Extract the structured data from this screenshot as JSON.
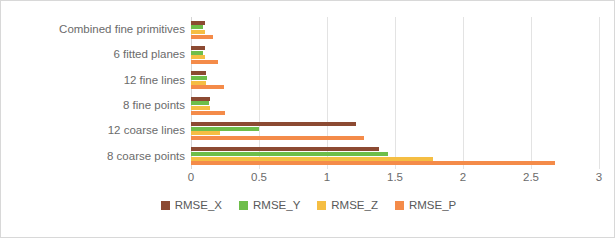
{
  "chart_data": {
    "type": "bar",
    "orientation": "horizontal",
    "title": "",
    "xlabel": "",
    "ylabel": "",
    "xlim": [
      0,
      3
    ],
    "xticks": [
      "0",
      "0.5",
      "1",
      "1.5",
      "2",
      "2.5",
      "3"
    ],
    "xtick_values": [
      0,
      0.5,
      1,
      1.5,
      2,
      2.5,
      3
    ],
    "grid": true,
    "legend_position": "bottom",
    "categories": [
      "Combined fine primitives",
      "6 fitted planes",
      "12 fine lines",
      "8 fine points",
      "12 coarse lines",
      "8 coarse points"
    ],
    "series": [
      {
        "name": "RMSE_X",
        "color": "#8C4A32",
        "values": [
          0.1,
          0.1,
          0.11,
          0.14,
          1.21,
          1.38
        ]
      },
      {
        "name": "RMSE_Y",
        "color": "#6EBE4A",
        "values": [
          0.085,
          0.085,
          0.12,
          0.13,
          0.5,
          1.45
        ]
      },
      {
        "name": "RMSE_Z",
        "color": "#F5BE43",
        "values": [
          0.1,
          0.1,
          0.11,
          0.14,
          0.21,
          1.78
        ]
      },
      {
        "name": "RMSE_P",
        "color": "#F48B49",
        "values": [
          0.16,
          0.2,
          0.24,
          0.25,
          1.27,
          2.68
        ]
      }
    ]
  },
  "colors": {
    "grid": "#e3e3e3",
    "axis_text": "#6b6b6b",
    "legend_text": "#595959",
    "background": "#ffffff",
    "frame_border": "#d8d8d8"
  }
}
